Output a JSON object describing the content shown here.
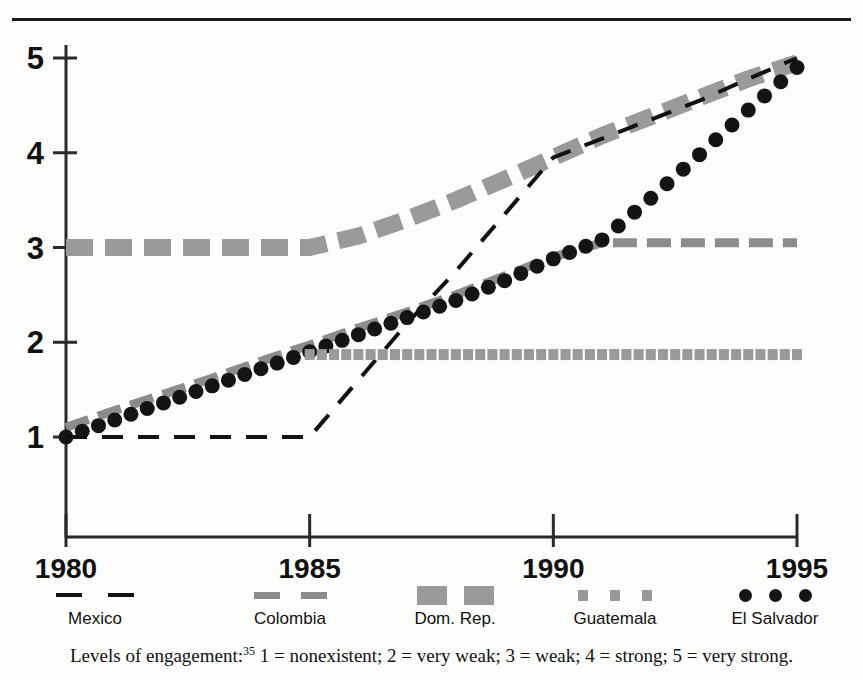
{
  "figure": {
    "caption_prefix": "Levels of engagement:",
    "caption_footnote": "35",
    "caption_body": " 1 = nonexistent; 2 = very weak; 3 = weak; 4 = strong; 5 = very strong."
  },
  "legend": {
    "items": [
      {
        "label": "Mexico",
        "marker": "dashed-line-black",
        "color": "#111111"
      },
      {
        "label": "Colombia",
        "marker": "dashed-line-gray",
        "color": "#8c8c8c"
      },
      {
        "label": "Dom. Rep.",
        "marker": "thick-dash-gray",
        "color": "#9a9a9a"
      },
      {
        "label": "Guatemala",
        "marker": "small-square-gray",
        "color": "#9a9a9a"
      },
      {
        "label": "El Salvador",
        "marker": "filled-circle-black",
        "color": "#141414"
      }
    ]
  },
  "chart_data": {
    "type": "line",
    "title": "",
    "xlabel": "",
    "ylabel": "",
    "xlim": [
      1980,
      1995
    ],
    "ylim": [
      1,
      5
    ],
    "grid": false,
    "legend_position": "bottom",
    "x_ticks": [
      "1980",
      "1985",
      "1990",
      "1995"
    ],
    "y_ticks": [
      "1",
      "2",
      "3",
      "4",
      "5"
    ],
    "x": [
      1980,
      1981,
      1982,
      1983,
      1984,
      1985,
      1986,
      1987,
      1988,
      1989,
      1990,
      1991,
      1992,
      1993,
      1994,
      1995
    ],
    "series": [
      {
        "name": "Mexico",
        "style": "dashed-line-black",
        "color": "#111111",
        "values": [
          1,
          1,
          1,
          1,
          1,
          1,
          1.6,
          2.2,
          2.75,
          3.35,
          3.95,
          4.15,
          4.35,
          4.55,
          4.78,
          5
        ]
      },
      {
        "name": "Colombia",
        "style": "dashed-line-gray",
        "color": "#8c8c8c",
        "values": [
          1.1,
          1.28,
          1.45,
          1.62,
          1.8,
          1.97,
          2.15,
          2.32,
          2.5,
          2.7,
          2.9,
          3.05,
          3.05,
          3.05,
          3.05,
          3.05
        ]
      },
      {
        "name": "Dom. Rep.",
        "style": "thick-dash-gray",
        "color": "#9a9a9a",
        "values": [
          3,
          3,
          3,
          3,
          3,
          3,
          3.12,
          3.3,
          3.5,
          3.72,
          3.95,
          4.18,
          4.38,
          4.58,
          4.78,
          4.95
        ]
      },
      {
        "name": "Guatemala",
        "style": "small-square-gray",
        "color": "#9a9a9a",
        "start_year": 1985,
        "values": [
          null,
          null,
          null,
          null,
          null,
          1.87,
          1.87,
          1.87,
          1.87,
          1.87,
          1.87,
          1.87,
          1.87,
          1.87,
          1.87,
          1.87
        ]
      },
      {
        "name": "El Salvador",
        "style": "filled-circle-black",
        "color": "#141414",
        "values": [
          1.0,
          1.18,
          1.36,
          1.54,
          1.72,
          1.9,
          2.08,
          2.26,
          2.44,
          2.65,
          2.88,
          3.08,
          3.52,
          3.98,
          4.45,
          4.9
        ]
      }
    ]
  }
}
